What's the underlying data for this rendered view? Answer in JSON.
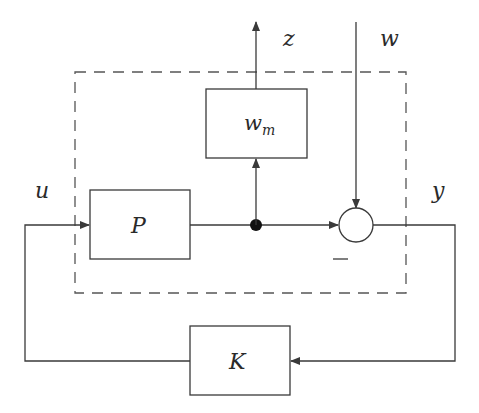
{
  "diagram": {
    "type": "block-diagram",
    "blocks": {
      "plant": {
        "label": "P"
      },
      "weight": {
        "label": "w",
        "subscript": "m"
      },
      "controller": {
        "label": "K"
      }
    },
    "signals": {
      "control_input": "u",
      "measured_output": "y",
      "performance_output": "z",
      "exogenous_input": "w"
    },
    "summing_junction": {
      "sign_label": "–"
    },
    "boundary": {
      "style": "dashed"
    },
    "colors": {
      "stroke": "#3a3a3a",
      "text": "#2a2a2a",
      "background": "#ffffff"
    }
  }
}
